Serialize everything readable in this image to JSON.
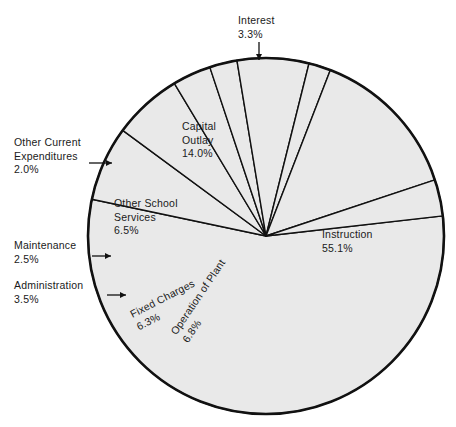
{
  "chart_data": {
    "type": "pie",
    "title": "",
    "subtitle": "",
    "xlabel": "",
    "ylabel": "",
    "legend_position": "none",
    "grid": false,
    "units": "percent",
    "categories": [
      "Instruction",
      "Interest",
      "Capital Outlay",
      "Other Current Expenditures",
      "Other School Services",
      "Maintenance",
      "Administration",
      "Fixed Charges",
      "Operation of Plant"
    ],
    "values": [
      55.1,
      3.3,
      14.0,
      2.0,
      6.5,
      2.5,
      3.5,
      6.3,
      6.8
    ],
    "slices": [
      {
        "name": "Instruction",
        "value": 55.1,
        "label": "Instruction\n55.1%",
        "label_mode": "inside",
        "label_x": 322,
        "label_y": 228,
        "label_rotation": 0,
        "start_deg": -6.5,
        "end_deg": 191.9
      },
      {
        "name": "Operation of Plant",
        "value": 6.8,
        "label": "Operation of Plant\n6.8%",
        "label_mode": "inside",
        "label_x": 168,
        "label_y": 330,
        "label_rotation": -56,
        "start_deg": 191.9,
        "end_deg": 216.4
      },
      {
        "name": "Fixed Charges",
        "value": 6.3,
        "label": "Fixed Charges\n6.3%",
        "label_mode": "inside",
        "label_x": 128,
        "label_y": 309,
        "label_rotation": -27,
        "start_deg": 216.4,
        "end_deg": 239.0
      },
      {
        "name": "Administration",
        "value": 3.5,
        "label": "Administration\n3.5%",
        "label_mode": "callout",
        "label_x": 14,
        "label_y": 279,
        "arrow_from_x": 107,
        "arrow_from_y": 295,
        "arrow_to_x": 126,
        "arrow_to_y": 295,
        "start_deg": 239.0,
        "end_deg": 251.6
      },
      {
        "name": "Maintenance",
        "value": 2.5,
        "label": "Maintenance\n2.5%",
        "label_mode": "callout",
        "label_x": 14,
        "label_y": 239,
        "arrow_from_x": 92,
        "arrow_from_y": 256,
        "arrow_to_x": 111,
        "arrow_to_y": 256,
        "start_deg": 251.6,
        "end_deg": 260.6
      },
      {
        "name": "Other School Services",
        "value": 6.5,
        "label": "Other School\nServices\n6.5%",
        "label_mode": "inside",
        "label_x": 114,
        "label_y": 197,
        "label_rotation": 0,
        "start_deg": 260.6,
        "end_deg": 284.0
      },
      {
        "name": "Other Current Expenditures",
        "value": 2.0,
        "label": "Other Current\nExpenditures\n2.0%",
        "label_mode": "callout",
        "label_x": 14,
        "label_y": 136,
        "arrow_from_x": 89,
        "arrow_from_y": 163,
        "arrow_to_x": 112,
        "arrow_to_y": 163,
        "start_deg": 284.0,
        "end_deg": 291.2
      },
      {
        "name": "Capital Outlay",
        "value": 14.0,
        "label": "Capital\nOutlay\n14.0%",
        "label_mode": "inside",
        "label_x": 182,
        "label_y": 120,
        "label_rotation": 0,
        "start_deg": 291.2,
        "end_deg": 341.6
      },
      {
        "name": "Interest",
        "value": 3.3,
        "label": "Interest\n3.3%",
        "label_mode": "callout",
        "label_x": 238,
        "label_y": 14,
        "arrow_from_x": 259,
        "arrow_from_y": 42,
        "arrow_to_x": 259,
        "arrow_to_y": 60,
        "start_deg": 341.6,
        "end_deg": 353.5
      }
    ],
    "geometry": {
      "center_x": 266,
      "center_y": 236,
      "radius": 178
    }
  }
}
